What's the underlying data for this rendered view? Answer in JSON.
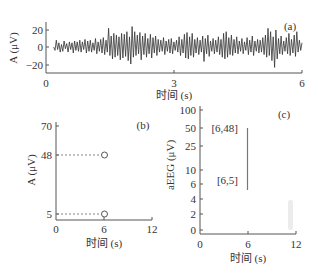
{
  "chart_data": [
    {
      "id": "a",
      "type": "line",
      "panel_label": "(a)",
      "title": "",
      "xlabel": "时间 (s)",
      "ylabel": "A (μV)",
      "xlim": [
        0,
        6
      ],
      "ylim": [
        -28,
        30
      ],
      "xticks": [
        0,
        3,
        6
      ],
      "yticks": [
        20,
        0,
        -20
      ],
      "xtick_labels": [
        "0",
        "3",
        "6"
      ],
      "ytick_labels": [
        "20",
        "0",
        "−20"
      ],
      "grid": false,
      "description": "Raw EEG signal oscillating between roughly -20 and +22 μV over 6 s",
      "series": [
        {
          "name": "EEG",
          "x_start": 0.18,
          "x_end": 6.0,
          "values": [
            0,
            -4,
            8,
            -3,
            5,
            -6,
            3,
            -5,
            7,
            -2,
            4,
            -6,
            6,
            -3,
            5,
            -7,
            7,
            -4,
            6,
            -5,
            8,
            -6,
            6,
            -3,
            9,
            -7,
            7,
            -5,
            8,
            -6,
            5,
            -4,
            10,
            -8,
            6,
            -5,
            9,
            -7,
            11,
            -9,
            8,
            -6,
            22,
            -10,
            13,
            -14,
            16,
            -12,
            14,
            -10,
            12,
            -15,
            16,
            -13,
            15,
            -11,
            18,
            -16,
            12,
            -20,
            24,
            -12,
            18,
            -10,
            14,
            -8,
            17,
            -15,
            13,
            -9,
            16,
            -12,
            10,
            -8,
            15,
            -13,
            11,
            -7,
            13,
            -10,
            9,
            -6,
            8,
            -5,
            11,
            -9,
            7,
            -5,
            9,
            -7,
            10,
            -8,
            6,
            -4,
            8,
            -6,
            12,
            -10,
            9,
            -7,
            15,
            -13,
            17,
            -14,
            12,
            -10,
            16,
            -12,
            9,
            -7,
            11,
            -9,
            8,
            -6,
            13,
            -17,
            10,
            -8,
            14,
            -11,
            7,
            -5,
            10,
            -8,
            8,
            -6,
            12,
            -9,
            9,
            -12,
            16,
            -14,
            18,
            -12,
            11,
            -9,
            14,
            -10,
            9,
            -7,
            12,
            -8,
            7,
            -5,
            10,
            -8,
            6,
            -4,
            11,
            -9,
            8,
            -6,
            13,
            -10,
            7,
            -5,
            9,
            -7,
            8,
            -6,
            11,
            -9,
            14,
            -12,
            22,
            -10,
            18,
            -16,
            12,
            -24,
            20,
            -14,
            10,
            -8,
            13,
            -9,
            7,
            -5,
            11,
            -8,
            16,
            -10,
            9,
            -7,
            14,
            -11,
            18,
            -6,
            8,
            -4,
            5
          ]
        }
      ]
    },
    {
      "id": "b",
      "type": "scatter",
      "panel_label": "(b)",
      "title": "",
      "xlabel": "时间 (s)",
      "ylabel": "A (μV)",
      "xlim": [
        0,
        12
      ],
      "ylim": [
        0,
        70
      ],
      "xticks": [
        0,
        6,
        12
      ],
      "yticks": [
        70,
        48,
        5
      ],
      "xtick_labels": [
        "0",
        "6",
        "12"
      ],
      "ytick_labels": [
        "70",
        "48",
        "5"
      ],
      "grid": false,
      "series": [
        {
          "name": "upper margin",
          "x": [
            6
          ],
          "y": [
            48
          ]
        },
        {
          "name": "lower margin",
          "x": [
            6
          ],
          "y": [
            5
          ]
        }
      ],
      "guides": "dashed horizontal lines from y-axis to each point"
    },
    {
      "id": "c",
      "type": "line",
      "panel_label": "(c)",
      "title": "",
      "xlabel": "时间 (s)",
      "ylabel": "aEEG (μV)",
      "xlim": [
        0,
        12
      ],
      "yscale": "semi-log (linear 0–10, log 10–100)",
      "xticks": [
        0,
        6,
        12
      ],
      "yticks": [
        100,
        50,
        25,
        10,
        6,
        4,
        2,
        0
      ],
      "xtick_labels": [
        "0",
        "6",
        "12"
      ],
      "ytick_labels": [
        "100",
        "50",
        "25",
        "10",
        "6",
        "4",
        "2",
        "0"
      ],
      "grid": false,
      "series": [
        {
          "name": "aEEG band",
          "x": [
            6,
            6
          ],
          "y": [
            5,
            48
          ]
        }
      ],
      "annotations": [
        "[6,48]",
        "[6,5]"
      ]
    }
  ]
}
